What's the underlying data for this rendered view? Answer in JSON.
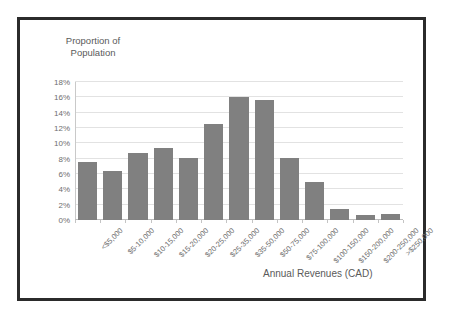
{
  "chart_data": {
    "type": "bar",
    "title": "Proportion of\nPopulation",
    "xlabel": "Annual Revenues (CAD)",
    "ylabel": "Proportion of Population",
    "categories": [
      "<$5,000",
      "$5-10,000",
      "$10-15,000",
      "$15-20,000",
      "$20-25,000",
      "$25-35,000",
      "$35-50,000",
      "$50-75,000",
      "$75-100,000",
      "$100-150,000",
      "$150-200,000",
      "$200-250,000",
      ">$250,000"
    ],
    "values": [
      7.6,
      6.4,
      8.7,
      9.4,
      8.1,
      12.5,
      16.0,
      15.7,
      8.1,
      5.0,
      1.5,
      0.6,
      0.8
    ],
    "ytick_labels": [
      "0%",
      "2%",
      "4%",
      "6%",
      "8%",
      "10%",
      "12%",
      "14%",
      "16%",
      "18%"
    ],
    "ytick_values": [
      0,
      2,
      4,
      6,
      8,
      10,
      12,
      14,
      16,
      18
    ],
    "ylim": [
      0,
      18
    ],
    "grid": true,
    "legend": false,
    "bar_color": "#808080",
    "gridline_color": "#e2e2e2",
    "text_color": "#5a5a5a",
    "frame_color": "#2b2b2b"
  }
}
